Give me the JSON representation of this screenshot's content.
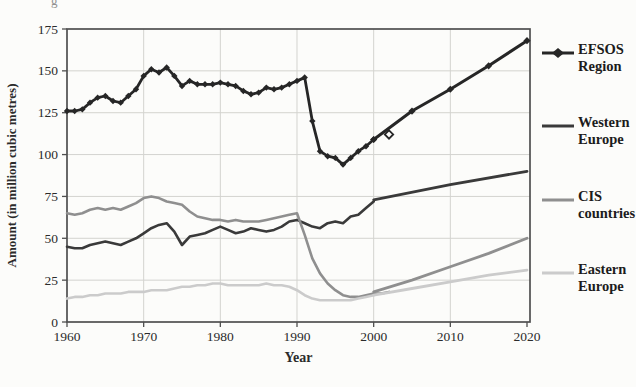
{
  "figure": {
    "caption_fragment": "g"
  },
  "axes": {
    "y": {
      "label": "Amount (in million cubic metres)",
      "ticks": [
        0,
        25,
        50,
        75,
        100,
        125,
        150,
        175
      ],
      "min": 0,
      "max": 175
    },
    "x": {
      "label": "Year",
      "ticks": [
        1960,
        1970,
        1980,
        1990,
        2000,
        2010,
        2020
      ],
      "min": 1960,
      "max": 2020
    }
  },
  "legend": [
    {
      "label": "EFSOS Region",
      "color": "#262626",
      "marker": "diamond"
    },
    {
      "label": "Western Europe",
      "color": "#3a3a3a",
      "marker": "none"
    },
    {
      "label": "CIS countries",
      "color": "#8f8f8f",
      "marker": "none"
    },
    {
      "label": "Eastern Europe",
      "color": "#cbcbcb",
      "marker": "none"
    }
  ],
  "colors": {
    "grid": "#d3d3cf",
    "axis_box": "#4f4f4f",
    "tick_text": "#2b2b2b",
    "background": "#fcfcfa"
  },
  "chart_data": {
    "type": "line",
    "title": "",
    "xlabel": "Year",
    "ylabel": "Amount (in million cubic metres)",
    "xlim": [
      1960,
      2020
    ],
    "ylim": [
      0,
      175
    ],
    "grid": true,
    "legend_position": "right",
    "series": [
      {
        "name": "EFSOS Region (historical)",
        "color": "#262626",
        "width": 2.8,
        "marker": "diamond",
        "marker_size": 3.2,
        "points": [
          [
            1960,
            126
          ],
          [
            1961,
            126
          ],
          [
            1962,
            127
          ],
          [
            1963,
            131
          ],
          [
            1964,
            134
          ],
          [
            1965,
            135
          ],
          [
            1966,
            132
          ],
          [
            1967,
            131
          ],
          [
            1968,
            135
          ],
          [
            1969,
            139
          ],
          [
            1970,
            147
          ],
          [
            1971,
            151
          ],
          [
            1972,
            149
          ],
          [
            1973,
            152
          ],
          [
            1974,
            147
          ],
          [
            1975,
            141
          ],
          [
            1976,
            144
          ],
          [
            1977,
            142
          ],
          [
            1978,
            142
          ],
          [
            1979,
            142
          ],
          [
            1980,
            143
          ],
          [
            1981,
            142
          ],
          [
            1982,
            141
          ],
          [
            1983,
            138
          ],
          [
            1984,
            136
          ],
          [
            1985,
            137
          ],
          [
            1986,
            140
          ],
          [
            1987,
            139
          ],
          [
            1988,
            140
          ],
          [
            1989,
            142
          ],
          [
            1990,
            144
          ],
          [
            1991,
            146
          ],
          [
            1992,
            120
          ],
          [
            1993,
            102
          ],
          [
            1994,
            99
          ],
          [
            1995,
            98
          ],
          [
            1996,
            94
          ],
          [
            1997,
            98
          ],
          [
            1998,
            102
          ],
          [
            1999,
            105
          ],
          [
            2000,
            109
          ]
        ]
      },
      {
        "name": "EFSOS Region (projection)",
        "color": "#262626",
        "width": 3.0,
        "marker": "diamond",
        "marker_size": 3.6,
        "open_markers": [
          [
            2002,
            112
          ]
        ],
        "points": [
          [
            2000,
            109
          ],
          [
            2005,
            126
          ],
          [
            2010,
            139
          ],
          [
            2015,
            153
          ],
          [
            2020,
            168
          ]
        ]
      },
      {
        "name": "Western Europe (historical)",
        "color": "#3a3a3a",
        "width": 2.6,
        "marker": "none",
        "points": [
          [
            1960,
            45
          ],
          [
            1961,
            44
          ],
          [
            1962,
            44
          ],
          [
            1963,
            46
          ],
          [
            1964,
            47
          ],
          [
            1965,
            48
          ],
          [
            1966,
            47
          ],
          [
            1967,
            46
          ],
          [
            1968,
            48
          ],
          [
            1969,
            50
          ],
          [
            1970,
            53
          ],
          [
            1971,
            56
          ],
          [
            1972,
            58
          ],
          [
            1973,
            59
          ],
          [
            1974,
            54
          ],
          [
            1975,
            46
          ],
          [
            1976,
            51
          ],
          [
            1977,
            52
          ],
          [
            1978,
            53
          ],
          [
            1979,
            55
          ],
          [
            1980,
            57
          ],
          [
            1981,
            55
          ],
          [
            1982,
            53
          ],
          [
            1983,
            54
          ],
          [
            1984,
            56
          ],
          [
            1985,
            55
          ],
          [
            1986,
            54
          ],
          [
            1987,
            55
          ],
          [
            1988,
            57
          ],
          [
            1989,
            60
          ],
          [
            1990,
            61
          ],
          [
            1991,
            59
          ],
          [
            1992,
            57
          ],
          [
            1993,
            56
          ],
          [
            1994,
            59
          ],
          [
            1995,
            60
          ],
          [
            1996,
            59
          ],
          [
            1997,
            63
          ],
          [
            1998,
            64
          ],
          [
            1999,
            68
          ],
          [
            2000,
            72
          ]
        ]
      },
      {
        "name": "Western Europe (projection)",
        "color": "#3a3a3a",
        "width": 2.8,
        "marker": "none",
        "points": [
          [
            2000,
            73
          ],
          [
            2010,
            82
          ],
          [
            2020,
            90
          ]
        ]
      },
      {
        "name": "CIS countries (historical)",
        "color": "#8f8f8f",
        "width": 2.6,
        "marker": "none",
        "points": [
          [
            1960,
            65
          ],
          [
            1961,
            64
          ],
          [
            1962,
            65
          ],
          [
            1963,
            67
          ],
          [
            1964,
            68
          ],
          [
            1965,
            67
          ],
          [
            1966,
            68
          ],
          [
            1967,
            67
          ],
          [
            1968,
            69
          ],
          [
            1969,
            71
          ],
          [
            1970,
            74
          ],
          [
            1971,
            75
          ],
          [
            1972,
            74
          ],
          [
            1973,
            72
          ],
          [
            1974,
            71
          ],
          [
            1975,
            70
          ],
          [
            1976,
            66
          ],
          [
            1977,
            63
          ],
          [
            1978,
            62
          ],
          [
            1979,
            61
          ],
          [
            1980,
            61
          ],
          [
            1981,
            60
          ],
          [
            1982,
            61
          ],
          [
            1983,
            60
          ],
          [
            1984,
            60
          ],
          [
            1985,
            60
          ],
          [
            1986,
            61
          ],
          [
            1987,
            62
          ],
          [
            1988,
            63
          ],
          [
            1989,
            64
          ],
          [
            1990,
            65
          ],
          [
            1991,
            52
          ],
          [
            1992,
            38
          ],
          [
            1993,
            29
          ],
          [
            1994,
            23
          ],
          [
            1995,
            19
          ],
          [
            1996,
            16
          ],
          [
            1997,
            15
          ],
          [
            1998,
            15
          ],
          [
            1999,
            16
          ],
          [
            2000,
            17
          ],
          [
            2001,
            17
          ],
          [
            2002,
            18
          ]
        ]
      },
      {
        "name": "CIS countries (projection)",
        "color": "#8f8f8f",
        "width": 2.8,
        "marker": "none",
        "points": [
          [
            2000,
            18
          ],
          [
            2005,
            25
          ],
          [
            2010,
            33
          ],
          [
            2015,
            41
          ],
          [
            2020,
            50
          ]
        ]
      },
      {
        "name": "Eastern Europe (historical)",
        "color": "#cbcbcb",
        "width": 2.6,
        "marker": "none",
        "points": [
          [
            1960,
            14
          ],
          [
            1961,
            15
          ],
          [
            1962,
            15
          ],
          [
            1963,
            16
          ],
          [
            1964,
            16
          ],
          [
            1965,
            17
          ],
          [
            1966,
            17
          ],
          [
            1967,
            17
          ],
          [
            1968,
            18
          ],
          [
            1969,
            18
          ],
          [
            1970,
            18
          ],
          [
            1971,
            19
          ],
          [
            1972,
            19
          ],
          [
            1973,
            19
          ],
          [
            1974,
            20
          ],
          [
            1975,
            21
          ],
          [
            1976,
            21
          ],
          [
            1977,
            22
          ],
          [
            1978,
            22
          ],
          [
            1979,
            23
          ],
          [
            1980,
            23
          ],
          [
            1981,
            22
          ],
          [
            1982,
            22
          ],
          [
            1983,
            22
          ],
          [
            1984,
            22
          ],
          [
            1985,
            22
          ],
          [
            1986,
            23
          ],
          [
            1987,
            22
          ],
          [
            1988,
            22
          ],
          [
            1989,
            21
          ],
          [
            1990,
            19
          ],
          [
            1991,
            16
          ],
          [
            1992,
            14
          ],
          [
            1993,
            13
          ],
          [
            1994,
            13
          ],
          [
            1995,
            13
          ],
          [
            1996,
            13
          ],
          [
            1997,
            13
          ],
          [
            1998,
            14
          ],
          [
            1999,
            15
          ],
          [
            2000,
            16
          ]
        ]
      },
      {
        "name": "Eastern Europe (projection)",
        "color": "#cbcbcb",
        "width": 2.8,
        "marker": "none",
        "points": [
          [
            2000,
            16
          ],
          [
            2005,
            20
          ],
          [
            2010,
            24
          ],
          [
            2015,
            28
          ],
          [
            2020,
            31
          ]
        ]
      }
    ]
  }
}
